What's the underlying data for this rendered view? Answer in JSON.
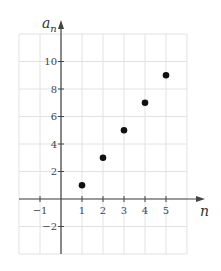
{
  "chart_data": {
    "type": "scatter",
    "title": "",
    "xlabel": "n",
    "ylabel": "a_n",
    "ylabel_base": "a",
    "ylabel_sub": "n",
    "x": [
      1,
      2,
      3,
      4,
      5
    ],
    "y": [
      1,
      3,
      5,
      7,
      9
    ],
    "series": [
      {
        "name": "a_n",
        "x": [
          1,
          2,
          3,
          4,
          5
        ],
        "values": [
          1,
          3,
          5,
          7,
          9
        ]
      }
    ],
    "xlim": [
      -2,
      6
    ],
    "ylim": [
      -4,
      12
    ],
    "x_ticks": [
      -1,
      1,
      2,
      3,
      4,
      5
    ],
    "x_tick_labels": [
      "−1",
      "1",
      "2",
      "3",
      "4",
      "5"
    ],
    "y_ticks": [
      -2,
      2,
      4,
      6,
      8,
      10
    ],
    "y_tick_labels": [
      "−2",
      "2",
      "4",
      "6",
      "8",
      "10"
    ],
    "grid": true,
    "legend": "none",
    "colors": {
      "point": "#111111",
      "axis": "#444444",
      "grid": "#e2e2e2",
      "text": "#444444"
    }
  }
}
